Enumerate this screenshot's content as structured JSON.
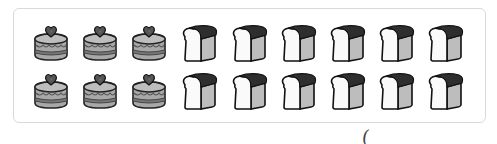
{
  "worksheet": {
    "rows": [
      {
        "items": [
          "cake",
          "cake",
          "cake",
          "bread",
          "bread",
          "bread",
          "bread",
          "bread",
          "bread"
        ]
      },
      {
        "items": [
          "cake",
          "cake",
          "cake",
          "bread",
          "bread",
          "bread",
          "bread",
          "bread",
          "bread"
        ]
      }
    ],
    "counts": {
      "cake": 6,
      "bread": 12
    },
    "answer_paren": "("
  }
}
